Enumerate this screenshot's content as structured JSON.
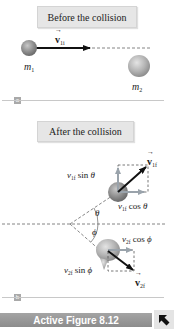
{
  "panel_a": {
    "title": "Before the collision",
    "tag": "a",
    "mass1_label": "m",
    "mass1_sub": "1",
    "mass2_label": "m",
    "mass2_sub": "2",
    "velocity_label": "v",
    "velocity_sub": "1i"
  },
  "panel_b": {
    "title": "After the collision",
    "tag": "b",
    "v1f_label": "v",
    "v1f_sub": "1f",
    "v1f_sin_prefix": "v",
    "v1f_sin_sub": "1f",
    "v1f_sin_fn": " sin ",
    "v1f_sin_angle": "θ",
    "v1f_cos_prefix": "v",
    "v1f_cos_sub": "1f",
    "v1f_cos_fn": " cos ",
    "v1f_cos_angle": "θ",
    "theta_label": "θ",
    "phi_label": "ϕ",
    "v2f_cos_prefix": "v",
    "v2f_cos_sub": "2f",
    "v2f_cos_fn": " cos ",
    "v2f_cos_angle": "ϕ",
    "v2f_sin_prefix": "v",
    "v2f_sin_sub": "2f",
    "v2f_sin_fn": " sin ",
    "v2f_sin_angle": "ϕ",
    "v2f_label": "v",
    "v2f_sub": "2f"
  },
  "footer": {
    "caption": "Active Figure 8.12",
    "button_icon": "arrow-up-left-icon"
  },
  "colors": {
    "label_box": "#e6e6e6",
    "ball_gray": "#8a8a8a",
    "component_arrow": "#9aa3ab",
    "footer_bar": "#999999",
    "tag_bg": "#a9a9a9"
  }
}
